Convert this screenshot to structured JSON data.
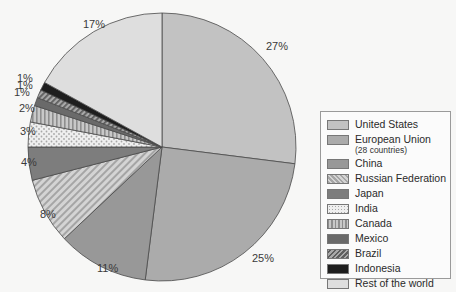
{
  "chart_data": {
    "type": "pie",
    "title": "",
    "categories": [
      "United States",
      "European Union (28 countries)",
      "China",
      "Russian Federation",
      "Japan",
      "India",
      "Canada",
      "Mexico",
      "Brazil",
      "Indonesia",
      "Rest of the world"
    ],
    "values": [
      27,
      25,
      11,
      8,
      4,
      3,
      2,
      1,
      1,
      1,
      17
    ],
    "unit": "%",
    "start_angle": "12 o'clock",
    "direction": "clockwise",
    "legend_position": "right",
    "labels": [
      "27%",
      "25%",
      "11%",
      "8%",
      "4%",
      "3%",
      "2%",
      "1%",
      "1%",
      "1%",
      "17%"
    ]
  },
  "legend": {
    "items": [
      {
        "label": "United States",
        "sub": "",
        "fill": "#c2c2c2",
        "pattern": "solid"
      },
      {
        "label": "European Union",
        "sub": "(28 countries)",
        "fill": "#ababab",
        "pattern": "solid"
      },
      {
        "label": "China",
        "sub": "",
        "fill": "#989898",
        "pattern": "solid"
      },
      {
        "label": "Russian Federation",
        "sub": "",
        "fill": "#c8c8c8",
        "pattern": "diagonal"
      },
      {
        "label": "Japan",
        "sub": "",
        "fill": "#7d7d7d",
        "pattern": "solid"
      },
      {
        "label": "India",
        "sub": "",
        "fill": "#e8e8e8",
        "pattern": "dots"
      },
      {
        "label": "Canada",
        "sub": "",
        "fill": "#b0b0b0",
        "pattern": "vertical"
      },
      {
        "label": "Mexico",
        "sub": "",
        "fill": "#6a6a6a",
        "pattern": "solid"
      },
      {
        "label": "Brazil",
        "sub": "",
        "fill": "#8c8c8c",
        "pattern": "diagonal-dark"
      },
      {
        "label": "Indonesia",
        "sub": "",
        "fill": "#1e1e1e",
        "pattern": "solid"
      },
      {
        "label": "Rest of the world",
        "sub": "",
        "fill": "#dedede",
        "pattern": "solid"
      }
    ]
  },
  "pie": {
    "cx": 162,
    "cy": 147,
    "r": 134
  }
}
